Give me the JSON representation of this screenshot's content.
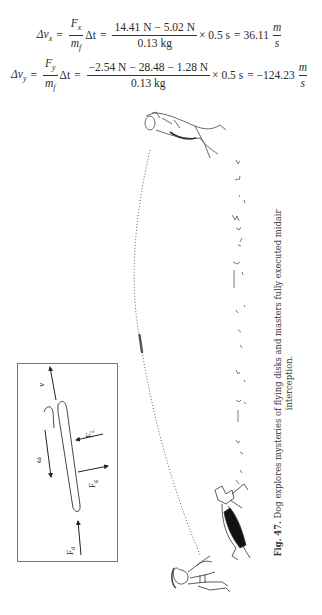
{
  "equations": [
    {
      "lhs": "Δv",
      "lhs_sub": "x",
      "ratio_num": "F",
      "ratio_num_sub": "x",
      "ratio_den": "m",
      "ratio_den_sub": "f",
      "dt": "Δt",
      "numerator": "14.41 N − 5.02 N",
      "denominator": "0.13 kg",
      "multiplier": "× 0.5 s",
      "result": "= 36.11",
      "unit_num": "m",
      "unit_den": "s"
    },
    {
      "lhs": "Δv",
      "lhs_sub": "y",
      "ratio_num": "F",
      "ratio_num_sub": "y",
      "ratio_den": "m",
      "ratio_den_sub": "f",
      "dt": "Δt",
      "numerator": "−2.54 N − 28.48 − 1.28 N",
      "denominator": "0.13 kg",
      "multiplier": "× 0.5 s",
      "result": "= −124.23",
      "unit_num": "m",
      "unit_den": "s"
    }
  ],
  "equals": "=",
  "diagram": {
    "labels": {
      "velocity": "v",
      "spin": "ω",
      "lift": "F",
      "lift_sub": "L",
      "gravity": "F",
      "gravity_sub": "g",
      "drag": "F",
      "drag_sub": "d"
    }
  },
  "caption": {
    "label": "Fig. 47.",
    "text": "Dog explores mysteries of flying disks and masters fully executed midair interception."
  },
  "colors": {
    "ink": "#2a2a2a",
    "box_border": "#777777",
    "trajectory": "#666666"
  }
}
